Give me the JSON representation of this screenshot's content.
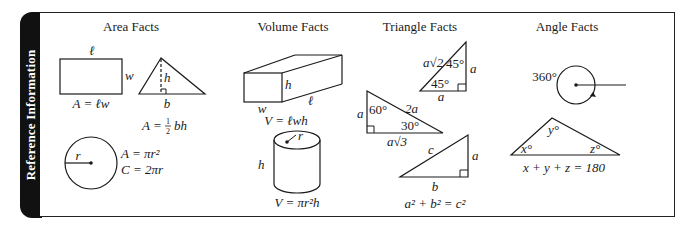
{
  "sidebar": {
    "label": "Reference Information"
  },
  "sections": {
    "area": {
      "title": "Area Facts",
      "rectangle": {
        "length_label": "ℓ",
        "width_label": "w",
        "formula": "A = ℓw"
      },
      "triangle": {
        "height_label": "h",
        "base_label": "b",
        "formula_prefix": "A = ",
        "formula_fraction_num": "1",
        "formula_fraction_den": "2",
        "formula_suffix": "bh"
      },
      "circle": {
        "radius_label": "r",
        "area_formula": "A = πr²",
        "circumference_formula": "C = 2πr"
      }
    },
    "volume": {
      "title": "Volume Facts",
      "box": {
        "height_label": "h",
        "width_label": "w",
        "length_label": "ℓ",
        "formula": "V = ℓwh"
      },
      "cylinder": {
        "radius_label": "r",
        "height_label": "h",
        "formula": "V = πr²h"
      }
    },
    "triangle": {
      "title": "Triangle Facts",
      "isosceles_right": {
        "hypotenuse_label": "a√2",
        "top_angle": "45°",
        "bottom_angle": "45°",
        "leg_vertical": "a",
        "leg_horizontal": "a"
      },
      "thirty_sixty_ninety": {
        "short_leg": "a",
        "angle_60": "60°",
        "hypotenuse": "2a",
        "angle_30": "30°",
        "long_leg": "a√3"
      },
      "pythagorean": {
        "hypotenuse": "c",
        "leg_vertical": "a",
        "leg_horizontal": "b",
        "formula": "a² + b² = c²"
      }
    },
    "angle": {
      "title": "Angle Facts",
      "full_rotation": {
        "label": "360°"
      },
      "triangle_sum": {
        "x_label": "x°",
        "y_label": "y°",
        "z_label": "z°",
        "formula": "x + y + z = 180"
      }
    }
  }
}
